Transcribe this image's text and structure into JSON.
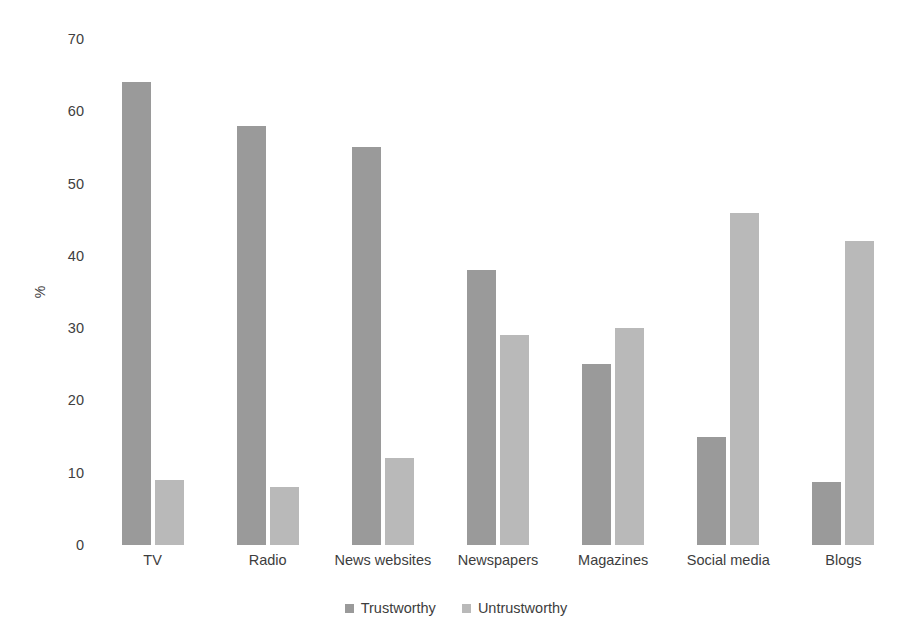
{
  "chart_data": {
    "type": "bar",
    "title": "",
    "xlabel": "",
    "ylabel": "%",
    "ylim": [
      0,
      70
    ],
    "ytick_step": 10,
    "yticks": [
      70,
      60,
      50,
      40,
      30,
      20,
      10,
      0
    ],
    "grid": false,
    "legend_position": "bottom-center",
    "categories": [
      "TV",
      "Radio",
      "News websites",
      "Newspapers",
      "Magazines",
      "Social media",
      "Blogs"
    ],
    "series": [
      {
        "name": "Trustworthy",
        "color": "#9a9a9a",
        "values": [
          64,
          58,
          55,
          38,
          25,
          15,
          8.7
        ]
      },
      {
        "name": "Untrustworthy",
        "color": "#b9b9b9",
        "values": [
          9,
          8,
          12,
          29,
          30,
          46,
          42
        ]
      }
    ]
  },
  "legend": {
    "items": [
      {
        "label": "Trustworthy",
        "color": "#9a9a9a"
      },
      {
        "label": "Untrustworthy",
        "color": "#b9b9b9"
      }
    ]
  },
  "axes": {
    "y_title": "%",
    "y_tick_labels": [
      "70",
      "60",
      "50",
      "40",
      "30",
      "20",
      "10",
      "0"
    ],
    "x_tick_labels": [
      "TV",
      "Radio",
      "News websites",
      "Newspapers",
      "Magazines",
      "Social media",
      "Blogs"
    ]
  }
}
